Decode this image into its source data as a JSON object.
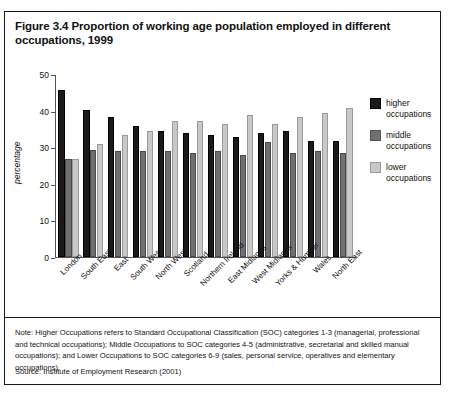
{
  "figure": {
    "title": "Figure 3.4 Proportion of working age population employed in different occupations, 1999",
    "note": "Note: Higher Occupations refers to Standard Occupational Classification (SOC) categories 1-3 (managerial, professional and technical occupations); Middle Occupations to SOC categories 4-5 (administrative, secretarial and skilled manual occupations); and Lower Occupations to SOC categories 6-9 (sales, personal service, operatives and elementary occupations).",
    "source": "Source: Institute of Employment Research (2001)"
  },
  "legend": {
    "items": [
      {
        "label": "higher occupations",
        "color": "#1a1a1a"
      },
      {
        "label": "middle occupations",
        "color": "#707070"
      },
      {
        "label": "lower occupations",
        "color": "#c8c8c8"
      }
    ]
  },
  "chart_data": {
    "type": "bar",
    "title": "Figure 3.4 Proportion of working age population employed in different occupations, 1999",
    "xlabel": "",
    "ylabel": "percentage",
    "ylim": [
      0,
      50
    ],
    "yticks": [
      0,
      10,
      20,
      30,
      40,
      50
    ],
    "grid": false,
    "legend_position": "right",
    "categories": [
      "London",
      "South East",
      "East",
      "South West",
      "North West",
      "Scotland",
      "Northern Ireland",
      "East Midlands",
      "West Midlands",
      "Yorks & Humber",
      "Wales",
      "North East"
    ],
    "series": [
      {
        "name": "higher occupations",
        "color": "#1a1a1a",
        "values": [
          46.0,
          40.5,
          38.5,
          36.0,
          34.5,
          34.0,
          33.5,
          33.0,
          34.0,
          34.5,
          32.0,
          32.0
        ]
      },
      {
        "name": "middle occupations",
        "color": "#707070",
        "values": [
          26.8,
          29.5,
          29.0,
          29.0,
          29.0,
          28.5,
          29.0,
          28.0,
          31.5,
          28.5,
          29.0,
          28.5
        ]
      },
      {
        "name": "lower occupations",
        "color": "#c8c8c8",
        "values": [
          27.0,
          31.0,
          33.5,
          34.5,
          37.5,
          37.5,
          36.5,
          39.0,
          36.5,
          38.5,
          39.5,
          41.0
        ]
      }
    ]
  }
}
